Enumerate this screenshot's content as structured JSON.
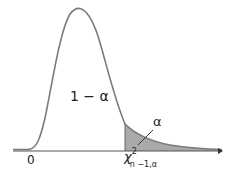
{
  "diagram": {
    "labels": {
      "central_area": "1 − α",
      "tail_area": "α",
      "origin": "0",
      "critical_symbol": "χ",
      "critical_sup": "2",
      "critical_sub": "n −1,α"
    },
    "colors": {
      "curve": "#7a7a7a",
      "axis": "#555555",
      "shade": "#a9a9a9",
      "text": "#222222"
    }
  }
}
